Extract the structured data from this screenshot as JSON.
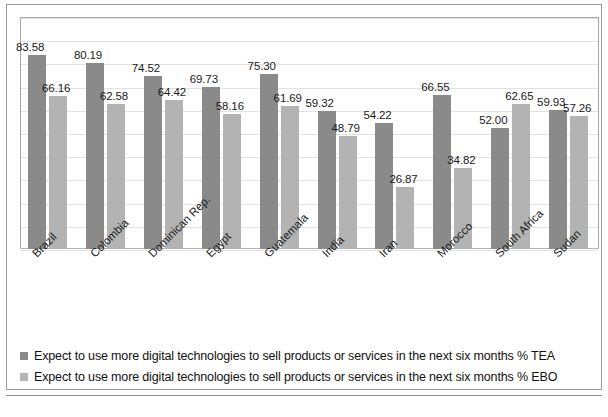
{
  "chart_data": {
    "type": "bar",
    "title": "",
    "subtitle": "",
    "xlabel": "",
    "ylabel": "",
    "ylim": [
      0,
      100
    ],
    "grid": true,
    "legend_position": "bottom",
    "categories": [
      "Brazil",
      "Colombia",
      "Dominican Rep.",
      "Egypt",
      "Guatemala",
      "India",
      "Iran",
      "Morocco",
      "South Africa",
      "Sudan"
    ],
    "series": [
      {
        "name": "Expect to use more digital technologies to sell products or services in the next six months % TEA",
        "short_name": "TEA",
        "color": "#8a8a8a",
        "values": [
          83.58,
          80.19,
          74.52,
          69.73,
          75.3,
          59.32,
          54.22,
          66.55,
          52.0,
          59.93
        ],
        "labels": [
          "83.58",
          "80.19",
          "74.52",
          "69.73",
          "75.30",
          "59.32",
          "54.22",
          "66.55",
          "52.00",
          "59.93"
        ]
      },
      {
        "name": "Expect to use more digital technologies to sell products or services in the next six months % EBO",
        "short_name": "EBO",
        "color": "#b3b3b3",
        "values": [
          66.16,
          62.58,
          64.42,
          58.16,
          61.69,
          48.79,
          26.87,
          34.82,
          62.65,
          57.26
        ],
        "labels": [
          "66.16",
          "62.58",
          "64.42",
          "58.16",
          "61.69",
          "48.79",
          "26.87",
          "34.82",
          "62.65",
          "57.26"
        ]
      }
    ]
  },
  "legend": {
    "items": [
      {
        "label": "Expect to use more digital technologies to sell products or services in the next six months % TEA",
        "color": "#8a8a8a"
      },
      {
        "label": "Expect to use more digital technologies to sell products or services in the next six months % EBO",
        "color": "#b3b3b3"
      }
    ]
  },
  "caption": {
    "text": ""
  }
}
